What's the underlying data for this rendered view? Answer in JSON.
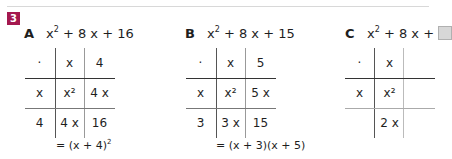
{
  "exercise_number": "3",
  "accent_color": "#a4184f",
  "tasks": [
    {
      "letter": "A",
      "expression": {
        "pre": "x",
        "exp": "2",
        "post": " + 8 x + 16"
      },
      "table": {
        "header": [
          "·",
          "x",
          "4"
        ],
        "rows": [
          [
            "x",
            "x²",
            "4 x"
          ],
          [
            "4",
            "4 x",
            "16"
          ]
        ]
      },
      "result": {
        "pre": "= (x + 4)",
        "exp": "2"
      }
    },
    {
      "letter": "B",
      "expression": {
        "pre": "x",
        "exp": "2",
        "post": " + 8 x + 15"
      },
      "table": {
        "header": [
          "·",
          "x",
          "5"
        ],
        "rows": [
          [
            "x",
            "x²",
            "5 x"
          ],
          [
            "3",
            "3 x",
            "15"
          ]
        ]
      },
      "result": {
        "pre": "= (x + 3)(x + 5)",
        "exp": ""
      }
    },
    {
      "letter": "C",
      "expression": {
        "pre": "x",
        "exp": "2",
        "post": " + 8 x + "
      },
      "table": {
        "header": [
          "·",
          "x",
          ""
        ],
        "rows": [
          [
            "x",
            "x²",
            ""
          ],
          [
            "",
            "2 x",
            ""
          ]
        ]
      },
      "result": {
        "pre": "",
        "exp": ""
      }
    }
  ]
}
